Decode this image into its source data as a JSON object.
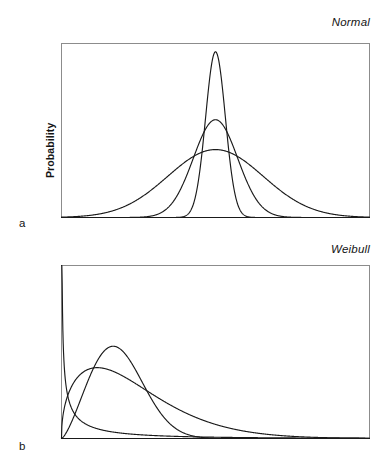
{
  "figure": {
    "background_color": "#ffffff",
    "line_color": "#1a1a1a",
    "frame_color": "#8c8c8c"
  },
  "panels": [
    {
      "letter": "a",
      "title": "Normal",
      "ylabel": "Probability"
    },
    {
      "letter": "b",
      "title": "Weibull",
      "ylabel": "Probability"
    }
  ],
  "chart_data": [
    {
      "type": "line",
      "title": "Normal",
      "xlabel": "",
      "ylabel": "Probability",
      "panel": "a",
      "grid": false,
      "legend": "none",
      "axis_ticks": "none",
      "xlim": [
        -5,
        5
      ],
      "ylim": [
        0,
        1.05
      ],
      "curve_family": "normal",
      "series": [
        {
          "name": "narrow",
          "mean": 0.0,
          "sigma": 0.32,
          "peak_height": 1.0,
          "comment": "tall sharp peak"
        },
        {
          "name": "medium",
          "mean": 0.0,
          "sigma": 0.72,
          "peak_height": 0.59,
          "comment": "intermediate width"
        },
        {
          "name": "wide",
          "mean": 0.0,
          "sigma": 1.55,
          "peak_height": 0.41,
          "comment": "broad flat curve"
        }
      ]
    },
    {
      "type": "line",
      "title": "Weibull",
      "xlabel": "",
      "ylabel": "Probability",
      "panel": "b",
      "grid": false,
      "legend": "none",
      "axis_ticks": "none",
      "xlim": [
        0,
        10
      ],
      "ylim": [
        0,
        1.05
      ],
      "curve_family": "weibull",
      "series": [
        {
          "name": "shape-below-one",
          "shape_k": 0.55,
          "scale_lambda": 0.95,
          "peak_height": 1.0,
          "comment": "decreasing from upper left, long tail"
        },
        {
          "name": "shape-near-one-point-five",
          "shape_k": 1.45,
          "scale_lambda": 2.6,
          "peak_height": 0.43,
          "comment": "broad low mode, long tail"
        },
        {
          "name": "shape-above-two",
          "shape_k": 2.4,
          "scale_lambda": 2.1,
          "peak_height": 0.56,
          "comment": "pronounced mode near x=1.6"
        }
      ]
    }
  ]
}
